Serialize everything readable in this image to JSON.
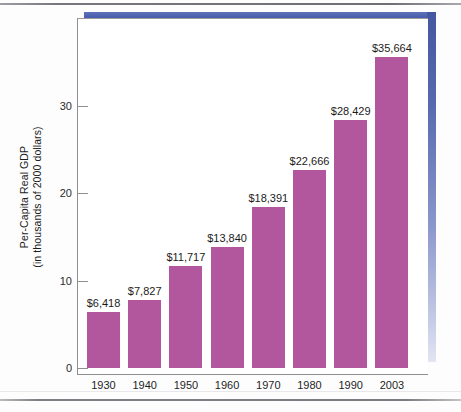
{
  "figure": {
    "y_axis_title_line1": "Per-Capita Real GDP",
    "y_axis_title_line2": "(in thousands of 2000 dollars)",
    "accent_color": "#b2569d",
    "frame_color": "#4a5fae"
  },
  "chart_data": {
    "type": "bar",
    "title": "",
    "xlabel": "",
    "ylabel": "Per-Capita Real GDP (in thousands of 2000 dollars)",
    "categories": [
      "1930",
      "1940",
      "1950",
      "1960",
      "1970",
      "1980",
      "1990",
      "2003"
    ],
    "values": [
      6.418,
      7.827,
      11.717,
      13.84,
      18.391,
      22.666,
      28.429,
      35.664
    ],
    "data_labels": [
      "$6,418",
      "$7,827",
      "$11,717",
      "$13,840",
      "$18,391",
      "$22,666",
      "$28,429",
      "$35,664"
    ],
    "ytick_labels": [
      "0",
      "10",
      "20",
      "30"
    ],
    "ytick_values": [
      0,
      10,
      20,
      30
    ],
    "ylim": [
      0,
      40.8
    ],
    "grid": false,
    "legend": null,
    "series_color": "#b2569d"
  }
}
